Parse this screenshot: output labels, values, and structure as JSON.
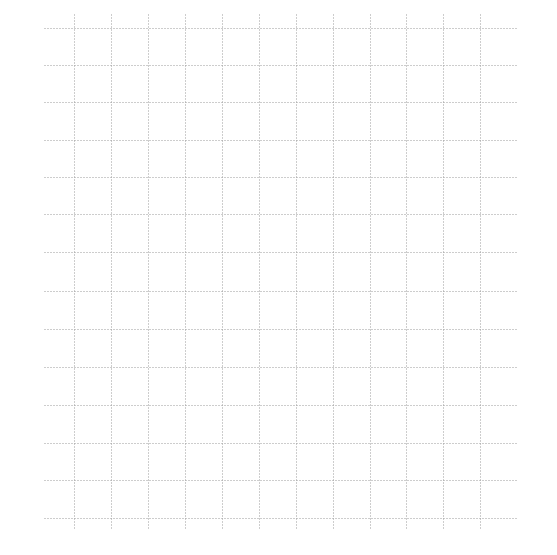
{
  "canvas": {
    "width": 557,
    "height": 555,
    "background": "#ffffff"
  },
  "grid": {
    "line_color": "#9a9a9a",
    "line_style": "dotted",
    "horizontal_lines_y": [
      28,
      65,
      102,
      140,
      177,
      214,
      252,
      291,
      329,
      367,
      405,
      443,
      480,
      518
    ],
    "horizontal_x_range": [
      44,
      517
    ],
    "vertical_lines_x": [
      74,
      111,
      148,
      185,
      222,
      259,
      296,
      333,
      370,
      406,
      443,
      480
    ],
    "vertical_y_range": [
      14,
      528
    ]
  }
}
